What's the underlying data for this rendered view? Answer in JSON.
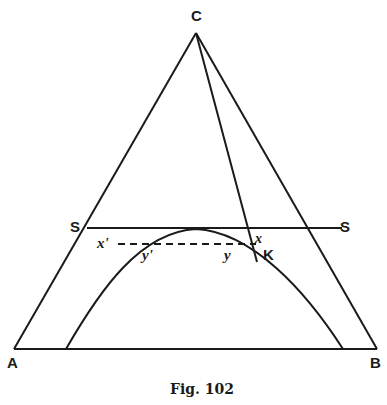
{
  "figure": {
    "caption": "Fig. 102",
    "colors": {
      "ink": "#1a1a1a",
      "background": "#ffffff"
    }
  },
  "points": {
    "C": {
      "label": "C",
      "x": 196,
      "y": 33
    },
    "A": {
      "label": "A",
      "x": 14,
      "y": 349
    },
    "B": {
      "label": "B",
      "x": 377,
      "y": 349
    },
    "S_left": {
      "label": "S",
      "x": 87,
      "y": 228
    },
    "S_right": {
      "label": "S",
      "x": 342,
      "y": 228
    },
    "x_prime": {
      "label": "x'"
    },
    "y_prime": {
      "label": "y'"
    },
    "y": {
      "label": "y"
    },
    "x": {
      "label": "x"
    },
    "K": {
      "label": "K",
      "x": 257,
      "y": 262
    }
  },
  "labels": {
    "C": "C",
    "A": "A",
    "B": "B",
    "S_left": "S",
    "S_right": "S",
    "x_prime": "x'",
    "y_prime": "y'",
    "y": "y",
    "x": "x",
    "K": "K"
  }
}
